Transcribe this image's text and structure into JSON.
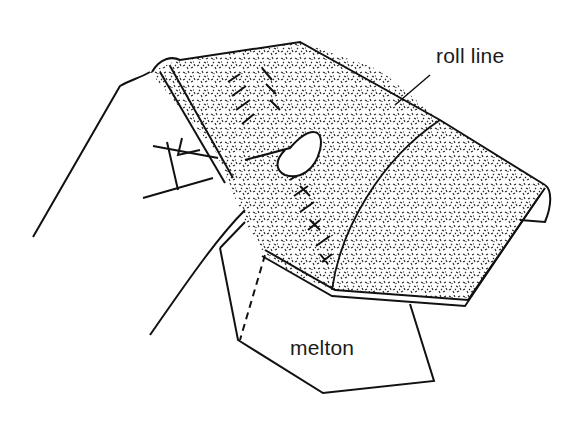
{
  "diagram": {
    "labels": {
      "roll_line": "roll line",
      "melton": "melton"
    },
    "colors": {
      "ink": "#111111",
      "paper": "#ffffff",
      "fabric_speckle": "#222222"
    }
  }
}
